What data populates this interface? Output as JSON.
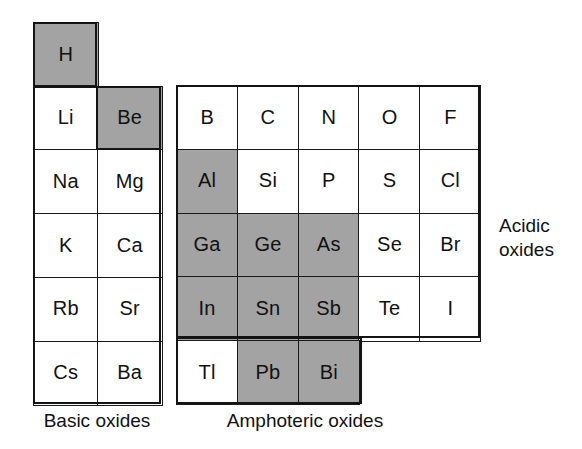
{
  "figure": {
    "type": "periodic-table-oxide-character-diagram",
    "shade_color": "#a3a3a3",
    "line_color": "#141414",
    "background": "#ffffff"
  },
  "legend": {
    "basic_label": "Basic oxides",
    "amphoteric_label": "Amphoteric oxides",
    "acidic_label_line1": "Acidic",
    "acidic_label_line2": "oxides"
  },
  "left_block": {
    "rows": [
      [
        {
          "symbol": "H",
          "shaded": true
        },
        null
      ],
      [
        {
          "symbol": "Li",
          "shaded": false
        },
        {
          "symbol": "Be",
          "shaded": true
        }
      ],
      [
        {
          "symbol": "Na",
          "shaded": false
        },
        {
          "symbol": "Mg",
          "shaded": false
        }
      ],
      [
        {
          "symbol": "K",
          "shaded": false
        },
        {
          "symbol": "Ca",
          "shaded": false
        }
      ],
      [
        {
          "symbol": "Rb",
          "shaded": false
        },
        {
          "symbol": "Sr",
          "shaded": false
        }
      ],
      [
        {
          "symbol": "Cs",
          "shaded": false
        },
        {
          "symbol": "Ba",
          "shaded": false
        }
      ]
    ]
  },
  "right_block": {
    "rows": [
      [
        {
          "symbol": "B",
          "shaded": false
        },
        {
          "symbol": "C",
          "shaded": false
        },
        {
          "symbol": "N",
          "shaded": false
        },
        {
          "symbol": "O",
          "shaded": false
        },
        {
          "symbol": "F",
          "shaded": false
        }
      ],
      [
        {
          "symbol": "Al",
          "shaded": true
        },
        {
          "symbol": "Si",
          "shaded": false
        },
        {
          "symbol": "P",
          "shaded": false
        },
        {
          "symbol": "S",
          "shaded": false
        },
        {
          "symbol": "Cl",
          "shaded": false
        }
      ],
      [
        {
          "symbol": "Ga",
          "shaded": true
        },
        {
          "symbol": "Ge",
          "shaded": true
        },
        {
          "symbol": "As",
          "shaded": true
        },
        {
          "symbol": "Se",
          "shaded": false
        },
        {
          "symbol": "Br",
          "shaded": false
        }
      ],
      [
        {
          "symbol": "In",
          "shaded": true
        },
        {
          "symbol": "Sn",
          "shaded": true
        },
        {
          "symbol": "Sb",
          "shaded": true
        },
        {
          "symbol": "Te",
          "shaded": false
        },
        {
          "symbol": "I",
          "shaded": false
        }
      ],
      [
        {
          "symbol": "Tl",
          "shaded": false
        },
        {
          "symbol": "Pb",
          "shaded": true
        },
        {
          "symbol": "Bi",
          "shaded": true
        },
        null,
        null
      ]
    ]
  },
  "shaded_elements": [
    "H",
    "Be",
    "Al",
    "Ga",
    "Ge",
    "As",
    "In",
    "Sn",
    "Sb",
    "Pb",
    "Bi"
  ]
}
